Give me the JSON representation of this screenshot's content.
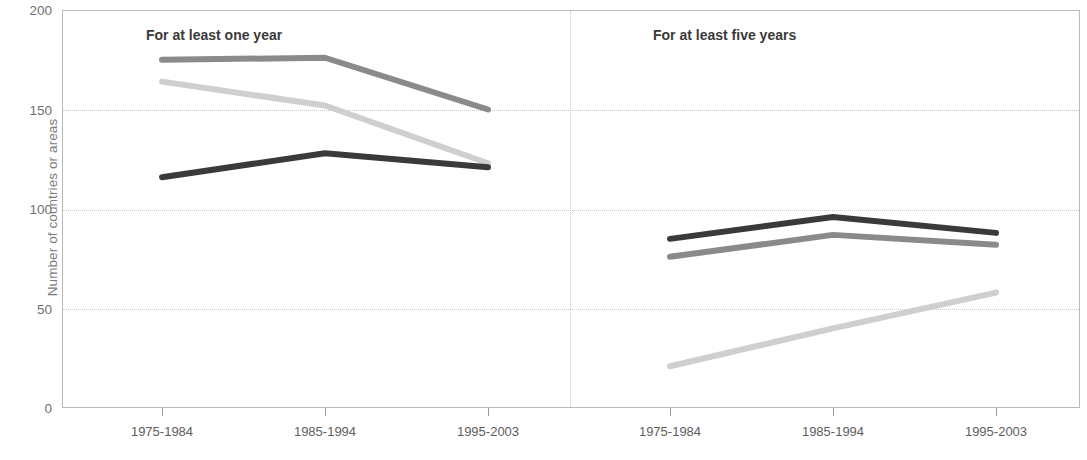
{
  "chart_data": {
    "type": "line",
    "title": "",
    "xlabel": "",
    "ylabel": "Number of countries or areas",
    "ylim": [
      0,
      200
    ],
    "yticks": [
      0,
      50,
      100,
      150,
      200
    ],
    "grid": true,
    "legend": "none",
    "categories": [
      "1975-1984",
      "1985-1994",
      "1995-2003"
    ],
    "panels": [
      {
        "name": "at-least-one-year",
        "title": "For at least one year",
        "series": [
          {
            "name": "series-medium-gray",
            "color": "#8a8a8a",
            "values": [
              175,
              176,
              150
            ]
          },
          {
            "name": "series-light-gray",
            "color": "#cfcfcf",
            "values": [
              164,
              152,
              123
            ]
          },
          {
            "name": "series-dark-gray",
            "color": "#3a3a3a",
            "values": [
              116,
              128,
              121
            ]
          }
        ]
      },
      {
        "name": "at-least-five-years",
        "title": "For at least five years",
        "series": [
          {
            "name": "series-dark-gray",
            "color": "#3a3a3a",
            "values": [
              85,
              96,
              88
            ]
          },
          {
            "name": "series-medium-gray",
            "color": "#8a8a8a",
            "values": [
              76,
              87,
              82
            ]
          },
          {
            "name": "series-light-gray",
            "color": "#cfcfcf",
            "values": [
              21,
              40,
              58
            ]
          }
        ]
      }
    ]
  },
  "axes": {
    "y_title": "Number of countries or areas",
    "y_ticks": [
      "200",
      "150",
      "100",
      "50",
      "0"
    ],
    "x_ticks_left": [
      "1975-1984",
      "1985-1994",
      "1995-2003"
    ],
    "x_ticks_right": [
      "1975-1984",
      "1985-1994",
      "1995-2003"
    ]
  },
  "panel_titles": {
    "left": "For at least one year",
    "right": "For at least five years"
  },
  "colors": {
    "dark": "#3a3a3a",
    "medium": "#8a8a8a",
    "light": "#cfcfcf",
    "grid": "#c9c9c9",
    "frame": "#b9b9b9",
    "tick_text": "#5d5d5d",
    "axis_title": "#7b7b7b"
  }
}
